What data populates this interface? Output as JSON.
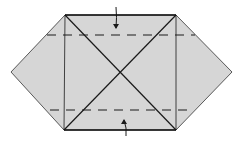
{
  "diagram": {
    "type": "origami-fold-diagram",
    "paper_fill": "#d6d6d6",
    "line_color": "#1a1a1a",
    "outline": [
      [
        65,
        15
      ],
      [
        176,
        15
      ],
      [
        232,
        72
      ],
      [
        176,
        130
      ],
      [
        64,
        130
      ],
      [
        11,
        72
      ]
    ],
    "vertical_creases": [
      {
        "x1": 65,
        "y1": 15,
        "x2": 64,
        "y2": 130
      },
      {
        "x1": 176,
        "y1": 15,
        "x2": 176,
        "y2": 130
      }
    ],
    "diagonal_creases": [
      {
        "x1": 65,
        "y1": 15,
        "x2": 176,
        "y2": 130
      },
      {
        "x1": 176,
        "y1": 15,
        "x2": 64,
        "y2": 130
      }
    ],
    "valley_folds": [
      {
        "x1": 47,
        "y1": 35,
        "x2": 195,
        "y2": 35
      },
      {
        "x1": 50,
        "y1": 110,
        "x2": 192,
        "y2": 110
      }
    ],
    "arrows": [
      {
        "name": "fold-down-arrow",
        "from": [
          116,
          7
        ],
        "to": [
          116,
          28
        ]
      },
      {
        "name": "fold-up-arrow",
        "from": [
          126,
          136
        ],
        "to": [
          124,
          120
        ]
      }
    ]
  }
}
